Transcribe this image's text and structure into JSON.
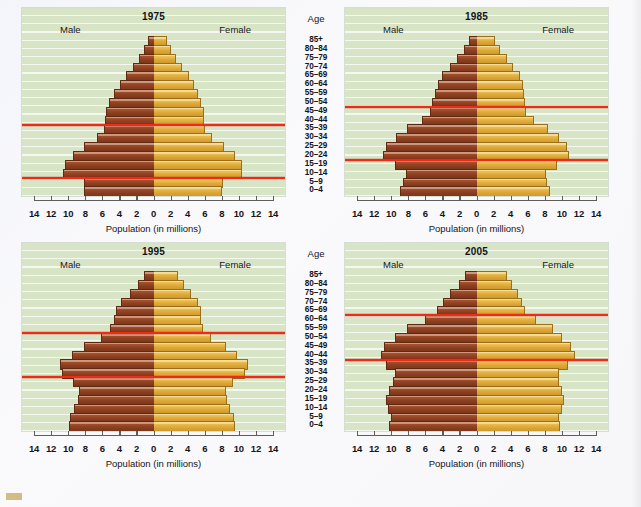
{
  "figure": {
    "age_header": "Age",
    "male_label": "Male",
    "female_label": "Female",
    "axis_title": "Population (in millions)",
    "age_groups": [
      "85+",
      "80–84",
      "75–79",
      "70–74",
      "65–69",
      "60–64",
      "55–59",
      "50–54",
      "45–49",
      "40–44",
      "35–39",
      "30–34",
      "25–29",
      "20–24",
      "15–19",
      "10–14",
      "5–9",
      "0–4"
    ],
    "tick_values": [
      14,
      12,
      10,
      8,
      6,
      4,
      2,
      0,
      2,
      4,
      6,
      8,
      10,
      12,
      14
    ],
    "colors": {
      "male_bar": "#9b4a24",
      "female_bar": "#e0ad36",
      "panel_background": "#d7e5c6",
      "reference_line": "#ef2b18",
      "page_background": "#f7f7fa"
    }
  },
  "chart_data": [
    {
      "type": "bar",
      "title": "1975",
      "subtitle": "",
      "xlabel": "Population (in millions)",
      "ylabel": "Age",
      "xlim": [
        -14,
        14
      ],
      "grid": true,
      "legend": [
        "Male",
        "Female"
      ],
      "categories": [
        "85+",
        "80–84",
        "75–79",
        "70–74",
        "65–69",
        "60–64",
        "55–59",
        "50–54",
        "45–49",
        "40–44",
        "35–39",
        "30–34",
        "25–29",
        "20–24",
        "15–19",
        "10–14",
        "5–9",
        "0–4"
      ],
      "series": [
        {
          "name": "Male",
          "values": [
            0.7,
            1.1,
            1.7,
            2.4,
            3.2,
            3.9,
            4.6,
            5.2,
            5.6,
            5.7,
            5.8,
            6.6,
            8.2,
            9.4,
            10.4,
            10.6,
            8.2,
            8.2
          ]
        },
        {
          "name": "Female",
          "values": [
            1.5,
            1.9,
            2.5,
            3.2,
            4.0,
            4.6,
            5.1,
            5.5,
            5.8,
            5.8,
            5.9,
            6.7,
            8.2,
            9.4,
            10.2,
            10.3,
            8.0,
            7.9
          ]
        }
      ],
      "annotations": [
        {
          "label": "baby-boom upper bound",
          "at_age_group": "35–39",
          "edge": "top"
        },
        {
          "label": "baby-boom lower bound",
          "at_age_group": "10–14",
          "edge": "bottom"
        }
      ]
    },
    {
      "type": "bar",
      "title": "1985",
      "subtitle": "",
      "xlabel": "Population (in millions)",
      "ylabel": "Age",
      "xlim": [
        -14,
        14
      ],
      "grid": true,
      "legend": [
        "Male",
        "Female"
      ],
      "categories": [
        "85+",
        "80–84",
        "75–79",
        "70–74",
        "65–69",
        "60–64",
        "55–59",
        "50–54",
        "45–49",
        "40–44",
        "35–39",
        "30–34",
        "25–29",
        "20–24",
        "15–19",
        "10–14",
        "5–9",
        "0–4"
      ],
      "series": [
        {
          "name": "Male",
          "values": [
            0.9,
            1.5,
            2.3,
            3.1,
            4.0,
            4.5,
            4.9,
            5.2,
            5.4,
            6.4,
            8.1,
            9.4,
            10.6,
            10.9,
            9.6,
            8.3,
            8.6,
            9.0
          ]
        },
        {
          "name": "Female",
          "values": [
            2.0,
            2.6,
            3.4,
            4.2,
            5.0,
            5.3,
            5.5,
            5.6,
            5.7,
            6.6,
            8.3,
            9.5,
            10.5,
            10.7,
            9.3,
            8.0,
            8.2,
            8.5
          ]
        }
      ],
      "annotations": [
        {
          "label": "baby-boom upper bound",
          "at_age_group": "45–49",
          "edge": "top"
        },
        {
          "label": "baby-boom lower bound",
          "at_age_group": "20–24",
          "edge": "bottom"
        }
      ]
    },
    {
      "type": "bar",
      "title": "1995",
      "subtitle": "",
      "xlabel": "Population (in millions)",
      "ylabel": "Age",
      "xlim": [
        -14,
        14
      ],
      "grid": true,
      "legend": [
        "Male",
        "Female"
      ],
      "categories": [
        "85+",
        "80–84",
        "75–79",
        "70–74",
        "65–69",
        "60–64",
        "55–59",
        "50–54",
        "45–49",
        "40–44",
        "35–39",
        "30–34",
        "25–29",
        "20–24",
        "15–19",
        "10–14",
        "5–9",
        "0–4"
      ],
      "series": [
        {
          "name": "Male",
          "values": [
            1.1,
            1.8,
            2.8,
            3.8,
            4.4,
            4.6,
            5.1,
            6.2,
            8.2,
            9.6,
            10.9,
            10.7,
            9.4,
            8.7,
            8.9,
            9.3,
            9.8,
            9.9
          ]
        },
        {
          "name": "Female",
          "values": [
            2.7,
            3.4,
            4.3,
            5.1,
            5.5,
            5.4,
            5.7,
            6.6,
            8.4,
            9.7,
            10.9,
            10.6,
            9.2,
            8.4,
            8.5,
            8.9,
            9.3,
            9.4
          ]
        }
      ],
      "annotations": [
        {
          "label": "baby-boom upper bound",
          "at_age_group": "50–54",
          "edge": "top"
        },
        {
          "label": "baby-boom lower bound",
          "at_age_group": "30–34",
          "edge": "bottom"
        }
      ]
    },
    {
      "type": "bar",
      "title": "2005",
      "subtitle": "",
      "xlabel": "Population (in millions)",
      "ylabel": "Age",
      "xlim": [
        -14,
        14
      ],
      "grid": true,
      "legend": [
        "Male",
        "Female"
      ],
      "categories": [
        "85+",
        "80–84",
        "75–79",
        "70–74",
        "65–69",
        "60–64",
        "55–59",
        "50–54",
        "45–49",
        "40–44",
        "35–39",
        "30–34",
        "25–29",
        "20–24",
        "15–19",
        "10–14",
        "5–9",
        "0–4"
      ],
      "series": [
        {
          "name": "Male",
          "values": [
            1.4,
            2.1,
            3.1,
            3.9,
            4.6,
            6.0,
            8.2,
            9.5,
            10.8,
            11.2,
            10.6,
            9.6,
            9.8,
            10.3,
            10.6,
            10.4,
            10.0,
            10.2
          ]
        },
        {
          "name": "Female",
          "values": [
            3.5,
            4.0,
            4.7,
            5.2,
            5.6,
            6.8,
            8.8,
            9.9,
            11.0,
            11.4,
            10.6,
            9.5,
            9.5,
            9.9,
            10.1,
            9.9,
            9.6,
            9.7
          ]
        }
      ],
      "annotations": [
        {
          "label": "baby-boom upper bound",
          "at_age_group": "60–64",
          "edge": "top"
        },
        {
          "label": "baby-boom lower bound",
          "at_age_group": "40–44",
          "edge": "bottom"
        }
      ]
    }
  ]
}
